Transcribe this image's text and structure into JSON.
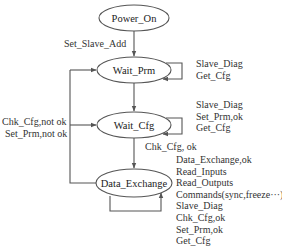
{
  "diagram": {
    "type": "state-machine",
    "states": [
      {
        "id": "power_on",
        "label": "Power_On"
      },
      {
        "id": "wait_prm",
        "label": "Wait_Prm"
      },
      {
        "id": "wait_cfg",
        "label": "Wait_Cfg"
      },
      {
        "id": "data_exchange",
        "label": "Data_Exchange"
      }
    ],
    "transitions": {
      "power_on_to_wait_prm": "Set_Slave_Add",
      "wait_cfg_to_data_exchange": "Chk_Cfg, ok",
      "back_to_wait_prm": [
        "Chk_Cfg,not ok",
        "Set_Prm,not ok"
      ]
    },
    "self_loops": {
      "wait_prm": [
        "Slave_Diag",
        "Get_Cfg"
      ],
      "wait_cfg": [
        "Slave_Diag",
        "Set_Prm,ok",
        "Get_Cfg"
      ],
      "data_exchange": [
        "Data_Exchange,ok",
        "Read_Inputs",
        "Read_Outputs",
        "Commands(sync,freeze···)",
        "Slave_Diag",
        "Chk_Cfg,ok",
        "Set_Prm,ok",
        "Get_Cfg"
      ]
    },
    "colors": {
      "stroke": "#555555",
      "text": "#333333",
      "background": "#ffffff"
    }
  }
}
